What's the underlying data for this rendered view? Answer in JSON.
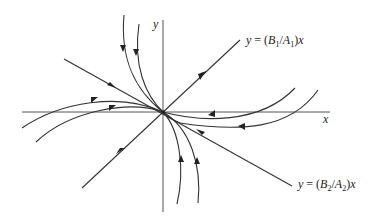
{
  "diagram": {
    "type": "phase-portrait",
    "axes": {
      "x_label": "x",
      "y_label": "y"
    },
    "lines": [
      {
        "label_prefix": "y = (B",
        "sub1": "1",
        "mid": "/A",
        "sub2": "1",
        "suffix": ")x",
        "name": "line-1"
      },
      {
        "label_prefix": "y = (B",
        "sub1": "2",
        "mid": "/A",
        "sub2": "2",
        "suffix": ")x",
        "name": "line-2"
      }
    ],
    "colors": {
      "stroke": "#333333",
      "background": "#ffffff"
    }
  }
}
